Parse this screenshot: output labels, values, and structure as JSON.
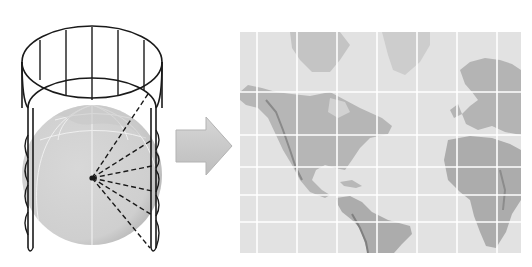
{
  "diagram": {
    "title": "Cylindrical (Mercator) projection",
    "colors": {
      "background": "#ffffff",
      "outline": "#1a1a1a",
      "globe": "#d4d4d4",
      "globe_shade": "#c2c2c2",
      "globe_grid": "#f4f4f4",
      "arrow": "#c9c9c9",
      "arrow_edge": "#b3b3b3",
      "ocean": "#e2e2e2",
      "land": "#b0b0b0",
      "land_dark": "#8f8f8f",
      "grid": "#ffffff"
    },
    "parts": {
      "cylinder": {
        "label": "Projection cylinder",
        "meridian_count": 7,
        "latitude_ring_count": 5
      },
      "globe": {
        "label": "Globe"
      },
      "rays": {
        "label": "Projection rays",
        "count": 7,
        "style": "dashed"
      },
      "arrow": {
        "label": "Unroll arrow",
        "direction": "right"
      },
      "map": {
        "label": "Flat projected world map",
        "style": "grayscale relief",
        "vertical_grid_lines": 7,
        "horizontal_grid_lines": 5
      }
    }
  }
}
